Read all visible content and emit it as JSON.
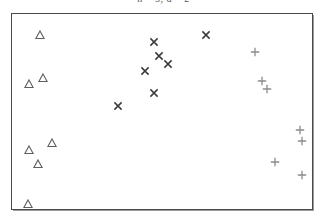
{
  "chart_data": {
    "type": "scatter",
    "title": "n = 5, d = 2",
    "title_clipped": true,
    "xlabel": "",
    "ylabel": "",
    "xlim": [
      0,
      302
    ],
    "ylim": [
      0,
      197
    ],
    "grid": false,
    "legend": "none",
    "axis_ticks": false,
    "axis_tick_labels": false,
    "background": "#ffffff",
    "frame_color": "#4a4a4a",
    "series": [
      {
        "name": "triangle-series",
        "marker": "triangle",
        "color": "#5f5f5f",
        "points": [
          {
            "x": 28,
            "y": 176
          },
          {
            "x": 17,
            "y": 126
          },
          {
            "x": 31,
            "y": 132
          },
          {
            "x": 17,
            "y": 60
          },
          {
            "x": 40,
            "y": 67
          },
          {
            "x": 26,
            "y": 45
          },
          {
            "x": 16,
            "y": 5
          }
        ]
      },
      {
        "name": "cross-series",
        "marker": "x",
        "color": "#3a3a3a",
        "points": [
          {
            "x": 143,
            "y": 169
          },
          {
            "x": 195,
            "y": 176
          },
          {
            "x": 148,
            "y": 155
          },
          {
            "x": 157,
            "y": 146
          },
          {
            "x": 134,
            "y": 139
          },
          {
            "x": 143,
            "y": 117
          },
          {
            "x": 107,
            "y": 104
          }
        ]
      },
      {
        "name": "plus-series",
        "marker": "plus",
        "color": "#8c8c8c",
        "points": [
          {
            "x": 245,
            "y": 159
          },
          {
            "x": 252,
            "y": 129
          },
          {
            "x": 257,
            "y": 121
          },
          {
            "x": 290,
            "y": 80
          },
          {
            "x": 292,
            "y": 69
          },
          {
            "x": 265,
            "y": 47
          },
          {
            "x": 292,
            "y": 34
          }
        ]
      }
    ]
  }
}
